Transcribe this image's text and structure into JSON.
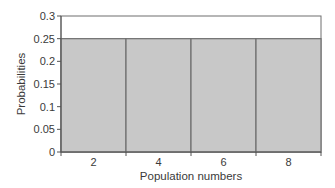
{
  "chart_data": {
    "type": "bar",
    "title": "",
    "categories": [
      "2",
      "4",
      "6",
      "8"
    ],
    "values": [
      0.25,
      0.25,
      0.25,
      0.25
    ],
    "xlabel": "Population numbers",
    "ylabel": "Probabilities",
    "ylim": [
      0,
      0.3
    ],
    "yticks": [
      "0",
      "0.05",
      "0.1",
      "0.15",
      "0.2",
      "0.25",
      "0.3"
    ],
    "ytick_values": [
      0,
      0.05,
      0.1,
      0.15,
      0.2,
      0.25,
      0.3
    ],
    "grid": false,
    "legend": null,
    "bar_fill": "#c8c8c8",
    "bar_edge": "#6e6e6e"
  }
}
